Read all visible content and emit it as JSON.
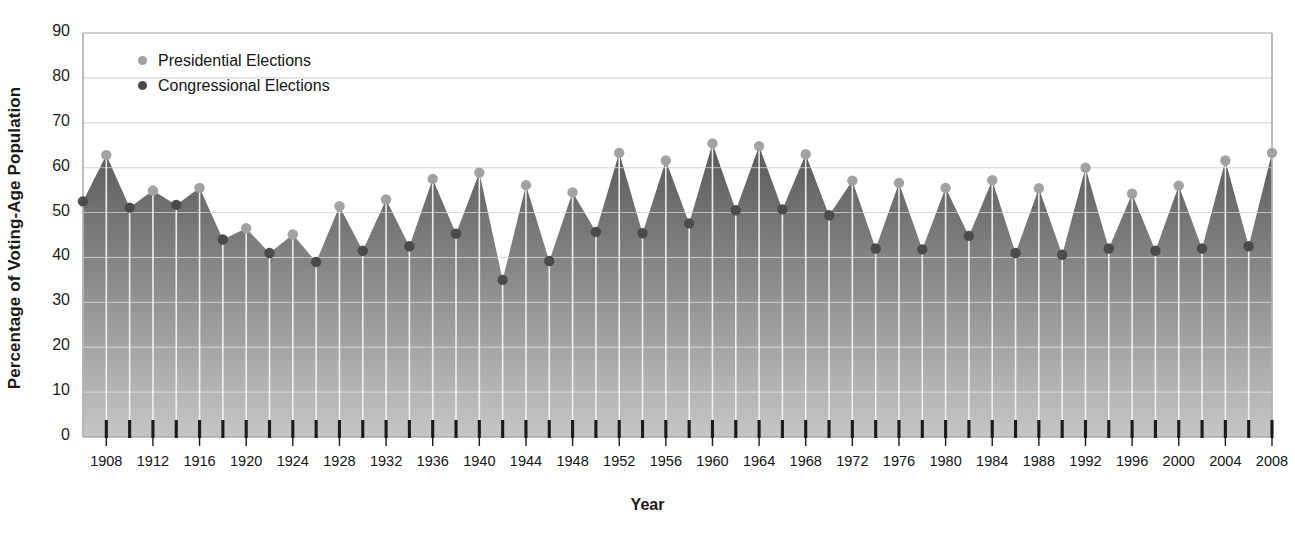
{
  "chart_data": {
    "type": "area",
    "title": "",
    "xlabel": "Year",
    "ylabel": "Percentage of Voting-Age Population",
    "ylim": [
      0,
      90
    ],
    "xlim": [
      1906,
      2008
    ],
    "y_ticks": [
      0,
      10,
      20,
      30,
      40,
      50,
      60,
      70,
      80,
      90
    ],
    "x_tick_labels": [
      1908,
      1912,
      1916,
      1920,
      1924,
      1928,
      1932,
      1936,
      1940,
      1944,
      1948,
      1952,
      1956,
      1960,
      1964,
      1968,
      1972,
      1976,
      1980,
      1984,
      1988,
      1992,
      1996,
      2000,
      2004,
      2008
    ],
    "x_tick_interval": 2,
    "grid": true,
    "legend_position": "top-left",
    "legend": [
      {
        "label": "Presidential Elections",
        "color": "#a0a0a0",
        "key": "presidential"
      },
      {
        "label": "Congressional Elections",
        "color": "#4a4a4a",
        "key": "congressional"
      }
    ],
    "colors": {
      "presidential_marker": "#a2a2a2",
      "congressional_marker": "#4b4b4b",
      "area_top": "#585858",
      "area_bottom": "#c6c6c6",
      "gridline": "#b9b9b9",
      "axis": "#8f8f8f",
      "stem": "#f4f4f4",
      "tick": "#1a1a1a"
    },
    "x": [
      1906,
      1908,
      1910,
      1912,
      1914,
      1916,
      1918,
      1920,
      1922,
      1924,
      1926,
      1928,
      1930,
      1932,
      1934,
      1936,
      1938,
      1940,
      1942,
      1944,
      1946,
      1948,
      1950,
      1952,
      1954,
      1956,
      1958,
      1960,
      1962,
      1964,
      1966,
      1968,
      1970,
      1972,
      1974,
      1976,
      1978,
      1980,
      1982,
      1984,
      1986,
      1988,
      1990,
      1992,
      1994,
      1996,
      1998,
      2000,
      2002,
      2004,
      2006,
      2008
    ],
    "series": [
      {
        "name": "Presidential Elections",
        "key": "presidential",
        "values": [
          null,
          62.8,
          null,
          54.9,
          null,
          55.5,
          null,
          46.5,
          null,
          45.1,
          null,
          51.4,
          null,
          52.9,
          null,
          57.5,
          null,
          58.9,
          null,
          56.1,
          null,
          54.5,
          null,
          63.3,
          null,
          61.6,
          null,
          65.4,
          null,
          64.8,
          null,
          63.0,
          null,
          57.1,
          null,
          56.6,
          null,
          55.5,
          null,
          57.2,
          null,
          55.4,
          null,
          60.0,
          null,
          54.2,
          null,
          56.0,
          null,
          61.6,
          null,
          63.3
        ],
        "marker": "circle",
        "color": "#a2a2a2"
      },
      {
        "name": "Congressional Elections",
        "key": "congressional",
        "values": [
          52.5,
          null,
          51.1,
          null,
          51.7,
          null,
          44.0,
          null,
          41.0,
          null,
          39.0,
          null,
          41.5,
          null,
          42.5,
          null,
          45.3,
          null,
          35.0,
          null,
          39.2,
          null,
          45.7,
          null,
          45.4,
          null,
          47.6,
          null,
          50.5,
          null,
          50.7,
          null,
          49.4,
          null,
          42.0,
          null,
          41.8,
          null,
          44.8,
          null,
          41.0,
          null,
          40.6,
          null,
          42.0,
          null,
          41.5,
          null,
          42.0,
          null,
          42.5,
          null
        ]
      }
    ]
  },
  "axis": {
    "y_title": "Percentage of Voting-Age Population",
    "x_title": "Year"
  }
}
